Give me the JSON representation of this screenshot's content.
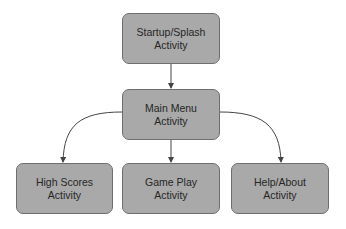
{
  "diagram": {
    "type": "flow",
    "nodes": [
      {
        "id": "splash",
        "line1": "Startup/Splash",
        "line2": "Activity"
      },
      {
        "id": "main",
        "line1": "Main Menu",
        "line2": "Activity"
      },
      {
        "id": "scores",
        "line1": "High Scores",
        "line2": "Activity"
      },
      {
        "id": "game",
        "line1": "Game Play",
        "line2": "Activity"
      },
      {
        "id": "help",
        "line1": "Help/About",
        "line2": "Activity"
      }
    ],
    "edges": [
      {
        "from": "splash",
        "to": "main"
      },
      {
        "from": "main",
        "to": "scores"
      },
      {
        "from": "main",
        "to": "game"
      },
      {
        "from": "main",
        "to": "help"
      }
    ],
    "colors": {
      "node_fill": "#a9a9a9",
      "node_border": "#6e6e6e",
      "edge": "#444444",
      "text": "#262626"
    }
  }
}
